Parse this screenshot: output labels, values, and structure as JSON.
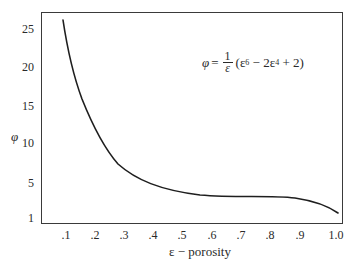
{
  "chart_data": {
    "type": "line",
    "title": "",
    "xlabel": "ε − porosity",
    "ylabel": "φ",
    "annotation": "φ = (1/ε)(ε⁶ − 2ε⁴ + 2)",
    "x_ticks": [
      ".1",
      ".2",
      ".3",
      ".4",
      ".5",
      ".6",
      ".7",
      ".8",
      ".9",
      "1.0"
    ],
    "y_ticks": [
      "1",
      "5",
      "10",
      "15",
      "20",
      "25"
    ],
    "xlim": [
      0.0,
      1.0
    ],
    "ylim": [
      1,
      27
    ],
    "grid": false,
    "legend": null,
    "series": [
      {
        "name": "φ(ε)",
        "x": [
          0.09,
          0.11,
          0.15,
          0.2,
          0.25,
          0.32,
          0.42,
          0.55,
          0.69,
          0.82,
          0.92,
          1.0
        ],
        "y": [
          26,
          21.6,
          16.5,
          11.1,
          8.1,
          5.9,
          4.3,
          3.4,
          3.1,
          3.2,
          2.6,
          1.1
        ]
      }
    ]
  },
  "labels": {
    "y_axis": "φ",
    "x_axis": "ε − porosity",
    "formula": {
      "lhs": "φ",
      "equals": "=",
      "frac_num": "1",
      "frac_den": "ε",
      "open": "(ε",
      "exp6": "6",
      "mid": " − 2ε",
      "exp4": "4",
      "tail": " + 2)"
    },
    "x_ticks": [
      {
        "label": ".1",
        "x": 66
      },
      {
        "label": ".2",
        "x": 95
      },
      {
        "label": ".3",
        "x": 124
      },
      {
        "label": ".4",
        "x": 153
      },
      {
        "label": ".5",
        "x": 182
      },
      {
        "label": ".6",
        "x": 212
      },
      {
        "label": ".7",
        "x": 241
      },
      {
        "label": ".8",
        "x": 270
      },
      {
        "label": ".9",
        "x": 300
      },
      {
        "label": "1.0",
        "x": 336
      }
    ],
    "y_ticks": [
      {
        "label": "25",
        "y": 23
      },
      {
        "label": "20",
        "y": 61
      },
      {
        "label": "15",
        "y": 100
      },
      {
        "label": "10",
        "y": 137
      },
      {
        "label": "5",
        "y": 177
      },
      {
        "label": "1",
        "y": 212
      }
    ]
  },
  "colors": {
    "line": "#1e1e1e",
    "axis": "#3a3a3a",
    "background": "#ffffff"
  }
}
